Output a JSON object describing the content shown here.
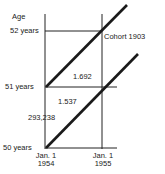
{
  "diagram": {
    "type": "lexis-diagram",
    "y_axis_title": "Age",
    "age_labels": [
      "52 years",
      "51 years",
      "50 years"
    ],
    "date_labels": [
      {
        "line1": "Jan. 1",
        "line2": "1954"
      },
      {
        "line1": "Jan. 1",
        "line2": "1955"
      }
    ],
    "cohort_label": "Cohort 1903",
    "values": {
      "upper_triangle": "1.692",
      "lower_triangle": "1.537",
      "cohort_count": "293,238"
    },
    "colors": {
      "lines": "#1a1a1a",
      "background": "#ffffff"
    }
  }
}
